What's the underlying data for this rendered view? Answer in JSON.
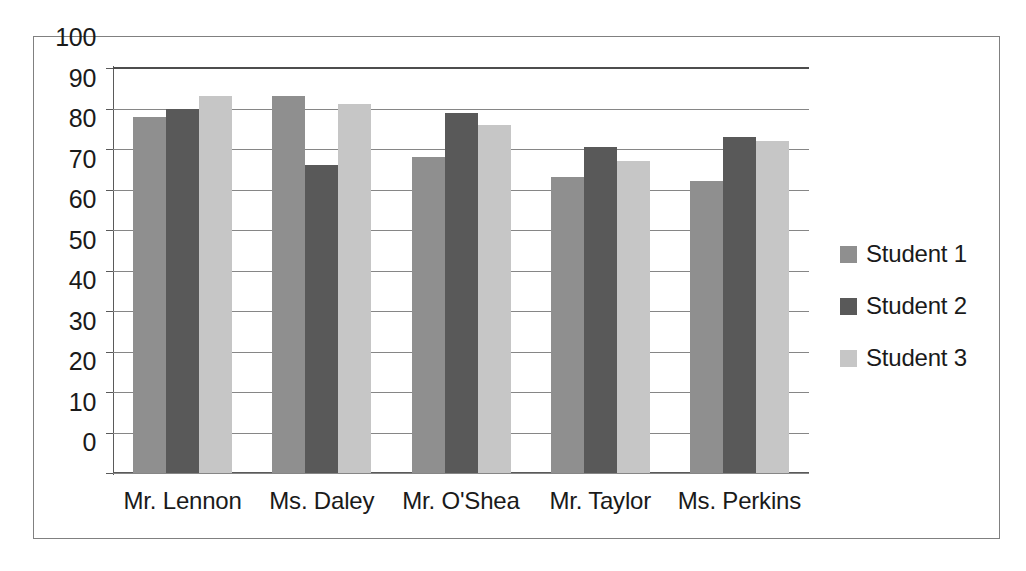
{
  "chart_data": {
    "type": "bar",
    "title": "",
    "subtitle": "",
    "xlabel": "",
    "ylabel": "",
    "ylim": [
      0,
      100
    ],
    "y_ticks": [
      0,
      10,
      20,
      30,
      40,
      50,
      60,
      70,
      80,
      90,
      100
    ],
    "grid": true,
    "legend_position": "right",
    "categories": [
      "Mr. Lennon",
      "Ms. Daley",
      "Mr. O'Shea",
      "Mr. Taylor",
      "Ms. Perkins"
    ],
    "series": [
      {
        "name": "Student 1",
        "color": "#8f8f8f",
        "values": [
          88,
          93,
          78,
          73,
          72
        ]
      },
      {
        "name": "Student 2",
        "color": "#595959",
        "values": [
          90,
          76,
          89,
          80.5,
          83
        ]
      },
      {
        "name": "Student 3",
        "color": "#c6c6c6",
        "values": [
          93,
          91,
          86,
          77,
          82
        ]
      }
    ]
  },
  "legend": {
    "items": [
      {
        "label": "Student 1",
        "color": "#8f8f8f"
      },
      {
        "label": "Student 2",
        "color": "#595959"
      },
      {
        "label": "Student 3",
        "color": "#c6c6c6"
      }
    ]
  },
  "axis": {
    "y_tick_labels": [
      "100",
      "90",
      "80",
      "70",
      "60",
      "50",
      "40",
      "30",
      "20",
      "10",
      "0"
    ],
    "x_tick_labels": [
      "Mr. Lennon",
      "Ms. Daley",
      "Mr. O'Shea",
      "Mr. Taylor",
      "Ms. Perkins"
    ]
  }
}
